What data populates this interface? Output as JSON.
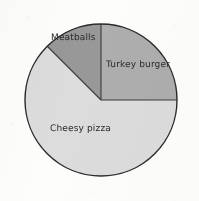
{
  "chart_data": {
    "type": "pie",
    "title": "",
    "subtitle": "",
    "xlabel": "",
    "ylabel": "",
    "grid": false,
    "legend_position": "none",
    "labels_inside_slices": true,
    "total_degrees": 360,
    "start_angle_deg": 0,
    "direction": "clockwise",
    "categories": [
      "Turkey burger",
      "Cheesy pizza",
      "Meatballs"
    ],
    "values": [
      25,
      62.5,
      12.5
    ],
    "value_unit": "percent",
    "slices": [
      {
        "label": "Turkey burger",
        "percent": 25,
        "fraction": "1/4",
        "degrees": 90,
        "start_deg": 0,
        "end_deg": 90,
        "color": "#aeaeae"
      },
      {
        "label": "Cheesy pizza",
        "percent": 62.5,
        "fraction": "5/8",
        "degrees": 225,
        "start_deg": 90,
        "end_deg": 315,
        "color": "#dcdcdc"
      },
      {
        "label": "Meatballs",
        "percent": 12.5,
        "fraction": "1/8",
        "degrees": 45,
        "start_deg": 315,
        "end_deg": 360,
        "color": "#989898"
      }
    ],
    "geometry": {
      "center_x": 101,
      "center_y": 100,
      "radius": 76
    },
    "style": {
      "background": "#fdfdfc",
      "outline_color": "#2a2a2a",
      "outline_width": 1.4,
      "divider_color": "#3a3a3a",
      "divider_width": 1.1,
      "label_color": "#2b2b2b"
    }
  },
  "labels": {
    "meatballs": "Meatballs",
    "turkey_burger": "Turkey burger",
    "cheesy_pizza": "Cheesy pizza"
  }
}
